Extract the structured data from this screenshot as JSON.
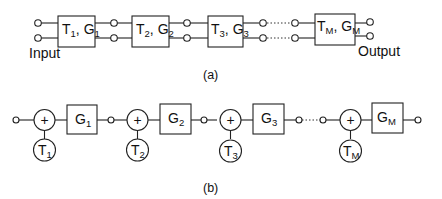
{
  "diagram_a": {
    "caption": "(a)",
    "input_label": "Input",
    "output_label": "Output",
    "blocks": [
      {
        "main": "T",
        "sub1": "1",
        "mid": ", G",
        "sub2": "1"
      },
      {
        "main": "T",
        "sub1": "2",
        "mid": ", G",
        "sub2": "2"
      },
      {
        "main": "T",
        "sub1": "3",
        "mid": ", G",
        "sub2": "3"
      },
      {
        "main": "T",
        "sub1": "M",
        "mid": ", G",
        "sub2": "M"
      }
    ]
  },
  "diagram_b": {
    "caption": "(b)",
    "adder_symbol": "+",
    "stages": [
      {
        "gain": "G",
        "gain_sub": "1",
        "noise": "T",
        "noise_sub": "1"
      },
      {
        "gain": "G",
        "gain_sub": "2",
        "noise": "T",
        "noise_sub": "2"
      },
      {
        "gain": "G",
        "gain_sub": "3",
        "noise": "T",
        "noise_sub": "3"
      },
      {
        "gain": "G",
        "gain_sub": "M",
        "noise": "T",
        "noise_sub": "M"
      }
    ]
  }
}
